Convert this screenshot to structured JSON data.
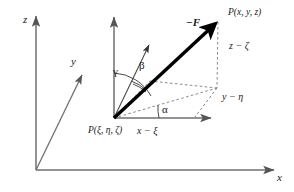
{
  "figure": {
    "colors": {
      "axis": "#6f6f6f",
      "vector": "#000000",
      "dashed": "#8a8a8a",
      "text": "#1a1a1a",
      "background": "#ffffff"
    }
  },
  "global_axes": {
    "x_label": "x",
    "y_label": "y",
    "z_label": "z"
  },
  "local_axes": {
    "vertical_label": "",
    "horizontal_label": ""
  },
  "points": {
    "field_point": "P(x, y, z)",
    "source_point": "P(ξ, η, ζ)"
  },
  "vector": {
    "label": "−F"
  },
  "angles": {
    "alpha": "α",
    "beta": "β",
    "gamma": "γ"
  },
  "components": {
    "dx": "x − ξ",
    "dy": "y − η",
    "dz": "z − ζ"
  }
}
